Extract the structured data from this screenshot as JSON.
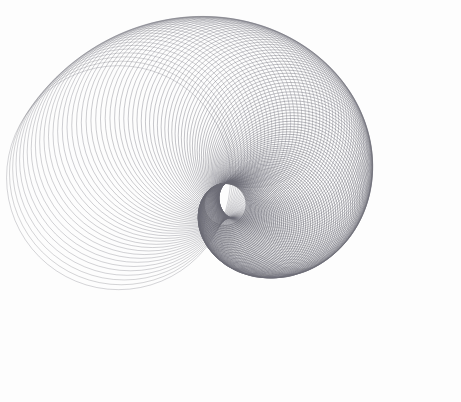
{
  "canvas": {
    "width": 461,
    "height": 402,
    "background_color": "#fdfdfd",
    "title": "Spiral Circle Envelope"
  },
  "style": {
    "stroke_color": "#6b6b75",
    "stroke_width": 0.62,
    "stroke_opacity": 0.85,
    "fill": "none",
    "line_join": "round"
  },
  "chart_data": {
    "type": "scatter",
    "title": "Spiral Circle Envelope",
    "subtitle": "",
    "xlabel": "",
    "ylabel": "",
    "grid": false,
    "legend_position": "none",
    "xlim": [
      0,
      461
    ],
    "ylim": [
      0,
      402
    ],
    "generator": {
      "shape": "circle",
      "count": 130,
      "parameter_range": [
        0,
        1
      ],
      "center_path": {
        "type": "logarithmic-spiral",
        "origin_x": 243,
        "origin_y": 196,
        "start_radius": 126,
        "end_radius": 20,
        "start_angle_deg": 171,
        "end_angle_deg": -153,
        "y_scale": 0.93
      },
      "circle_radius": {
        "start": 112,
        "end": 21,
        "easing": "power",
        "exponent": 1.28
      },
      "opacity_ramp": {
        "start": 0.52,
        "end": 0.95
      },
      "width_ramp": {
        "start": 0.55,
        "end": 0.72
      }
    },
    "series": [
      {
        "name": "circle-family",
        "values": [
          112,
          109,
          106,
          103,
          100,
          97,
          94,
          91,
          88,
          85,
          82,
          79,
          76,
          73,
          70,
          67,
          64,
          61,
          58,
          55,
          52,
          49,
          46,
          43,
          40,
          37,
          34,
          31,
          28,
          25,
          22,
          21
        ]
      }
    ],
    "annotations": []
  }
}
